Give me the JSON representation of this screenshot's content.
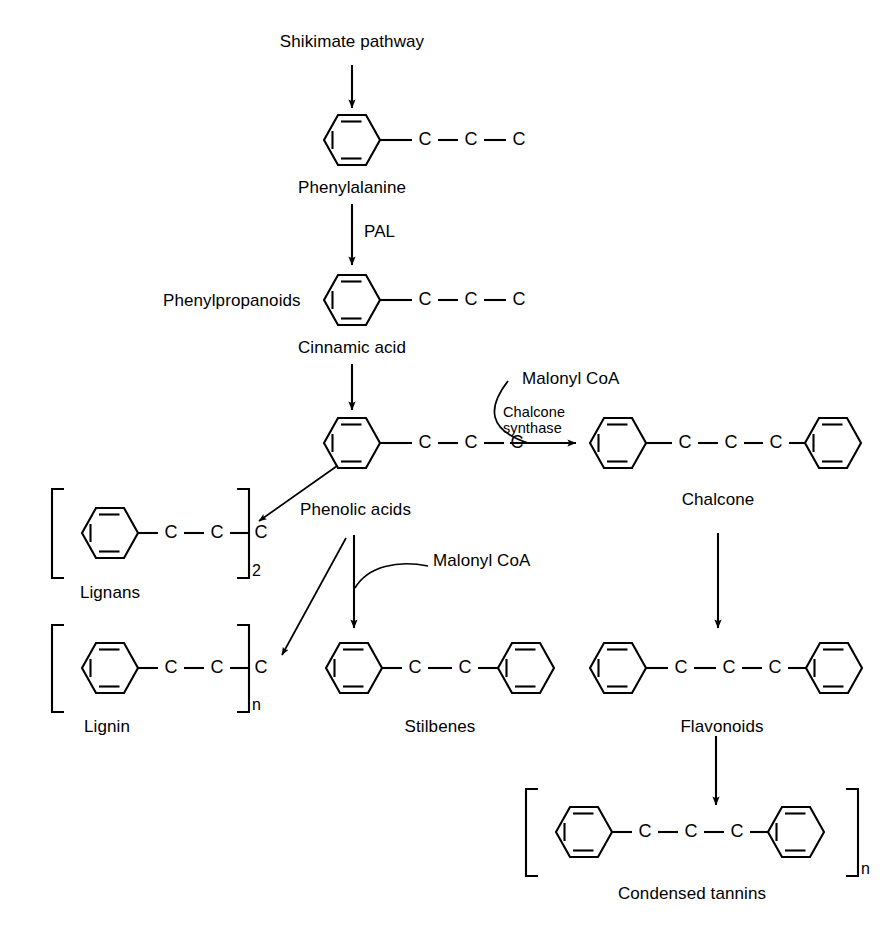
{
  "figure": {
    "background_color": "#ffffff",
    "line_color": "#000000",
    "width": 890,
    "height": 935
  },
  "nodes": {
    "shikimate_pathway": "Shikimate pathway",
    "phenylalanine": "Phenylalanine",
    "phenylpropanoids": "Phenylpropanoids",
    "cinnamic_acid": "Cinnamic acid",
    "phenolic_acids": "Phenolic acids",
    "lignans": "Lignans",
    "lignin": "Lignin",
    "stilbenes": "Stilbenes",
    "chalcone": "Chalcone",
    "flavonoids": "Flavonoids",
    "condensed_tannins": "Condensed tannins"
  },
  "enzymes": {
    "pal": "PAL",
    "chalcone_synthase_line1": "Chalcone",
    "chalcone_synthase_line2": "synthase"
  },
  "cofactors": {
    "malonyl_coa_top": "Malonyl CoA",
    "malonyl_coa_mid": "Malonyl CoA"
  },
  "subscripts": {
    "lignans": "2",
    "lignin": "n",
    "condensed_tannins": "n"
  },
  "atoms": {
    "carbon": "C"
  },
  "structures": [
    {
      "name": "phenylalanine",
      "skeleton": "ring-C-C-C",
      "bracketed": false,
      "subscript": null
    },
    {
      "name": "cinnamic-acid",
      "skeleton": "ring-C-C-C",
      "bracketed": false,
      "subscript": null
    },
    {
      "name": "phenolic-acids",
      "skeleton": "ring-C-C-C",
      "bracketed": false,
      "subscript": null
    },
    {
      "name": "lignans",
      "skeleton": "ring-C-C-C",
      "bracketed": true,
      "subscript": "2"
    },
    {
      "name": "lignin",
      "skeleton": "ring-C-C-C",
      "bracketed": true,
      "subscript": "n"
    },
    {
      "name": "stilbenes",
      "skeleton": "ring-C-C-ring",
      "bracketed": false,
      "subscript": null
    },
    {
      "name": "chalcone",
      "skeleton": "ring-C-C-C-ring",
      "bracketed": false,
      "subscript": null
    },
    {
      "name": "flavonoids",
      "skeleton": "ring-C-C-C-ring",
      "bracketed": false,
      "subscript": null
    },
    {
      "name": "condensed-tannins",
      "skeleton": "ring-C-C-C-ring",
      "bracketed": true,
      "subscript": "n"
    }
  ],
  "edges": [
    {
      "from": "shikimate-pathway",
      "to": "phenylalanine",
      "label": ""
    },
    {
      "from": "phenylalanine",
      "to": "cinnamic-acid",
      "label": "PAL"
    },
    {
      "from": "cinnamic-acid",
      "to": "phenolic-acids",
      "label": ""
    },
    {
      "from": "phenolic-acids",
      "to": "lignans",
      "label": ""
    },
    {
      "from": "phenolic-acids",
      "to": "lignin",
      "label": ""
    },
    {
      "from": "phenolic-acids",
      "to": "stilbenes",
      "label": "Malonyl CoA"
    },
    {
      "from": "phenolic-acids",
      "to": "chalcone",
      "label": "Chalcone synthase / Malonyl CoA"
    },
    {
      "from": "chalcone",
      "to": "flavonoids",
      "label": ""
    },
    {
      "from": "flavonoids",
      "to": "condensed-tannins",
      "label": ""
    }
  ]
}
